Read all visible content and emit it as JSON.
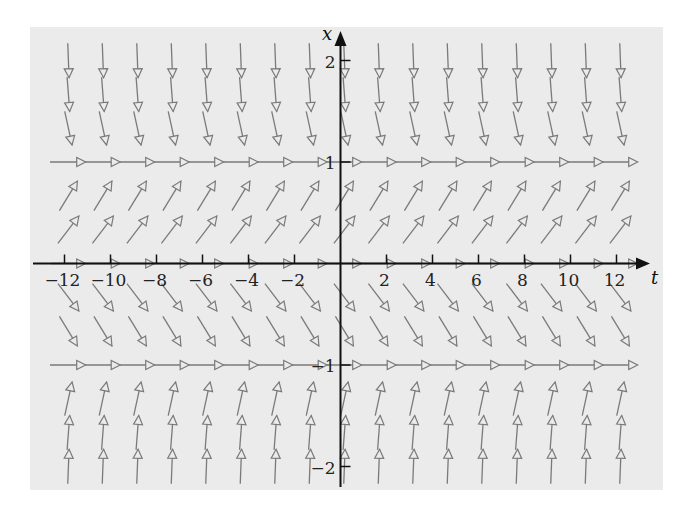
{
  "chart_data": {
    "type": "slope-field",
    "title": "",
    "equation": "dx/dt = x(1 - x^2)",
    "xlabel": "t",
    "ylabel": "x",
    "xlim": [
      -13,
      13
    ],
    "ylim": [
      -2.1,
      2.2
    ],
    "t_ticks": [
      -12,
      -10,
      -8,
      -6,
      -4,
      -2,
      2,
      4,
      6,
      8,
      10,
      12
    ],
    "t_tick_labels": [
      "−12",
      "−10",
      "−8",
      "−6",
      "−4",
      "−2",
      "2",
      "4",
      "6",
      "8",
      "10",
      "12"
    ],
    "x_ticks": [
      2,
      1,
      -1,
      -2
    ],
    "x_tick_labels": [
      "2",
      "1",
      "−1",
      "−2"
    ],
    "grid": false,
    "field_columns_t": [
      -11.83,
      -10.33,
      -8.83,
      -7.33,
      -5.83,
      -4.33,
      -2.83,
      -1.33,
      0.17,
      1.67,
      3.17,
      4.67,
      6.17,
      7.67,
      9.17,
      10.67,
      12.17
    ],
    "field_rows_x": [
      2,
      1.6667,
      1.3333,
      1,
      0.6667,
      0.3333,
      0,
      -0.3333,
      -0.6667,
      -1,
      -1.3333,
      -1.6667,
      -2
    ],
    "equilibria": [
      -1,
      0,
      1
    ],
    "colors": {
      "background": "#ebebeb",
      "arrow": "#7a7a7a",
      "axis": "#111111"
    }
  }
}
